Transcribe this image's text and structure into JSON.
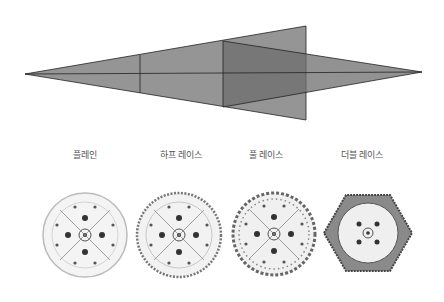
{
  "diagram": {
    "fill_color": "#808080",
    "stroke_color": "#222222"
  },
  "labels": [
    {
      "text": "플레인",
      "x": 85
    },
    {
      "text": "하프 레이스",
      "x": 181
    },
    {
      "text": "풀 레이스",
      "x": 266
    },
    {
      "text": "더블 레이스",
      "x": 362
    }
  ],
  "plates": [
    {
      "name": "plain",
      "cx": 85,
      "cy": 235,
      "r": 42,
      "shape": "circle"
    },
    {
      "name": "half-lace",
      "cx": 179,
      "cy": 235,
      "r": 42,
      "shape": "circle"
    },
    {
      "name": "full-lace",
      "cx": 274,
      "cy": 234,
      "r": 41,
      "shape": "circle"
    },
    {
      "name": "double-lace",
      "cx": 368,
      "cy": 233,
      "r": 44,
      "shape": "hexagon"
    }
  ]
}
